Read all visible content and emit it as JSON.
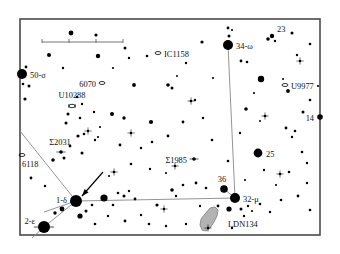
{
  "chart_title": "Star Finder Chart",
  "frame": {
    "x": 20,
    "y": 19,
    "width": 300,
    "height": 216,
    "border_color": "#4a4a4a",
    "background": "#ffffff"
  },
  "scale_bar": {
    "x1": 42,
    "x2": 123,
    "y": 42,
    "ticks": [
      42,
      69,
      96,
      123
    ],
    "label": "",
    "color": "#666666"
  },
  "colors": {
    "star": "#000000",
    "line": "#888888",
    "nebula_fill": "#b3b3b3",
    "nebula_stroke": "#7d7d7d",
    "text": "#111111",
    "border": "#4a4a4a",
    "arrow": "#000000"
  },
  "chart_data": {
    "type": "scatter",
    "xlabel": "",
    "ylabel": "",
    "grid": false,
    "legend": "none",
    "xlim": [
      20,
      320
    ],
    "ylim": [
      19,
      235
    ],
    "labeled_stars": [
      {
        "name": "50-σ",
        "x": 22,
        "y": 74,
        "r": 5.0,
        "label_dx": 8,
        "label_dy": 3.5,
        "anchor": "start"
      },
      {
        "name": "34-ω",
        "x": 228,
        "y": 45,
        "r": 5.0,
        "label_dx": 8,
        "label_dy": 3.5,
        "anchor": "start"
      },
      {
        "name": "23",
        "x": 272,
        "y": 36,
        "r": 2.2,
        "label_dx": 5,
        "label_dy": -4,
        "anchor": "start"
      },
      {
        "name": "14",
        "x": 320,
        "y": 117,
        "r": 2.8,
        "label_dx": -6,
        "label_dy": 3.5,
        "anchor": "end"
      },
      {
        "name": "25",
        "x": 258,
        "y": 153,
        "r": 4.4,
        "label_dx": 8,
        "label_dy": 3.5,
        "anchor": "start"
      },
      {
        "name": "36",
        "x": 224,
        "y": 189,
        "r": 3.8,
        "label_dx": -2,
        "label_dy": -7,
        "anchor": "middle"
      },
      {
        "name": "32-μ",
        "x": 235,
        "y": 198,
        "r": 5.0,
        "label_dx": 8,
        "label_dy": 3.5,
        "anchor": "start"
      },
      {
        "name": "1-δ",
        "x": 76,
        "y": 201,
        "r": 6.0,
        "label_dx": -9,
        "label_dy": 2,
        "anchor": "end"
      },
      {
        "name": "2-ε",
        "x": 44,
        "y": 227,
        "r": 6.0,
        "label_dx": -9,
        "label_dy": -3,
        "anchor": "end"
      }
    ],
    "labeled_objects": [
      {
        "name": "IC1158",
        "x": 158,
        "y": 53,
        "marker": "ellipse",
        "label_dx": 6,
        "label_dy": 3.5,
        "anchor": "start"
      },
      {
        "name": "U9977",
        "x": 285,
        "y": 85,
        "marker": "ellipse",
        "label_dx": 6,
        "label_dy": 3.5,
        "anchor": "start"
      },
      {
        "name": "6070",
        "x": 102,
        "y": 83,
        "marker": "ellipse",
        "label_dx": -6,
        "label_dy": 3.5,
        "anchor": "end"
      },
      {
        "name": "U10288",
        "x": 72,
        "y": 106,
        "marker": "barred",
        "label_dx": 0,
        "label_dy": -8,
        "anchor": "middle"
      },
      {
        "name": "6118",
        "x": 22,
        "y": 155,
        "marker": "ellipse",
        "label_dx": 0,
        "label_dy": 12,
        "anchor": "start"
      },
      {
        "name": "Σ2031",
        "x": 61,
        "y": 152,
        "marker": "double",
        "label_dx": -1,
        "label_dy": -7,
        "anchor": "middle"
      },
      {
        "name": "Σ1985",
        "x": 194,
        "y": 159,
        "marker": "double",
        "label_dx": -7,
        "label_dy": 3.5,
        "anchor": "end"
      }
    ],
    "nebula": {
      "name": "LDN134",
      "label_x": 228,
      "label_y": 227,
      "path": "M 205 214 L 210 208 L 215 207 L 218 210 L 217 216 L 214 222 L 210 228 L 206 231 L 202 230 L 200 225 L 201 219 Z"
    },
    "constellation_lines": [
      {
        "from": [
          76,
          201
        ],
        "to": [
          235,
          198
        ]
      },
      {
        "from": [
          235,
          198
        ],
        "to": [
          228,
          45
        ]
      },
      {
        "from": [
          76,
          201
        ],
        "to": [
          44,
          227
        ]
      },
      {
        "from": [
          76,
          201
        ],
        "to": [
          20,
          131
        ]
      },
      {
        "from": [
          76,
          201
        ],
        "to": [
          44,
          212
        ]
      },
      {
        "from": [
          44,
          227
        ],
        "to": [
          32,
          238
        ]
      },
      {
        "from": [
          235,
          198
        ],
        "to": [
          224,
          189
        ]
      }
    ],
    "pointer_arrow": {
      "from": [
        103,
        172
      ],
      "to": [
        82,
        196
      ]
    },
    "field_stars": [
      {
        "x": 71,
        "y": 33,
        "r": 2.4
      },
      {
        "x": 96,
        "y": 35,
        "r": 1.6
      },
      {
        "x": 125,
        "y": 48,
        "r": 1.5
      },
      {
        "x": 129,
        "y": 58,
        "r": 1.2
      },
      {
        "x": 49,
        "y": 55,
        "r": 2.0
      },
      {
        "x": 98,
        "y": 56,
        "r": 2.2
      },
      {
        "x": 147,
        "y": 56,
        "r": 1.3
      },
      {
        "x": 202,
        "y": 42,
        "r": 1.6
      },
      {
        "x": 228,
        "y": 28,
        "r": 1.4
      },
      {
        "x": 229,
        "y": 36,
        "r": 1.5
      },
      {
        "x": 232,
        "y": 30,
        "r": 1.1
      },
      {
        "x": 268,
        "y": 39,
        "r": 1.8
      },
      {
        "x": 275,
        "y": 41,
        "r": 1.2
      },
      {
        "x": 292,
        "y": 33,
        "r": 1.5
      },
      {
        "x": 310,
        "y": 44,
        "r": 1.3
      },
      {
        "x": 241,
        "y": 61,
        "r": 1.4
      },
      {
        "x": 247,
        "y": 62,
        "r": 1.3
      },
      {
        "x": 297,
        "y": 55,
        "r": 1.2
      },
      {
        "x": 26,
        "y": 67,
        "r": 1.4
      },
      {
        "x": 23,
        "y": 84,
        "r": 1.3
      },
      {
        "x": 29,
        "y": 86,
        "r": 1.5
      },
      {
        "x": 25,
        "y": 99,
        "r": 1.6
      },
      {
        "x": 134,
        "y": 85,
        "r": 1.9
      },
      {
        "x": 168,
        "y": 85,
        "r": 1.8
      },
      {
        "x": 172,
        "y": 88,
        "r": 1.5
      },
      {
        "x": 261,
        "y": 79,
        "r": 3.2
      },
      {
        "x": 283,
        "y": 79,
        "r": 1.0
      },
      {
        "x": 288,
        "y": 91,
        "r": 1.9
      },
      {
        "x": 310,
        "y": 100,
        "r": 1.3
      },
      {
        "x": 195,
        "y": 100,
        "r": 1.2
      },
      {
        "x": 246,
        "y": 109,
        "r": 1.8
      },
      {
        "x": 303,
        "y": 112,
        "r": 1.5
      },
      {
        "x": 77,
        "y": 97,
        "r": 1.2
      },
      {
        "x": 82,
        "y": 104,
        "r": 1.2
      },
      {
        "x": 68,
        "y": 114,
        "r": 1.5
      },
      {
        "x": 80,
        "y": 118,
        "r": 1.3
      },
      {
        "x": 94,
        "y": 112,
        "r": 1.2
      },
      {
        "x": 112,
        "y": 114,
        "r": 2.0
      },
      {
        "x": 124,
        "y": 118,
        "r": 1.7
      },
      {
        "x": 151,
        "y": 122,
        "r": 2.1
      },
      {
        "x": 183,
        "y": 122,
        "r": 1.4
      },
      {
        "x": 286,
        "y": 128,
        "r": 1.4
      },
      {
        "x": 295,
        "y": 131,
        "r": 1.3
      },
      {
        "x": 292,
        "y": 137,
        "r": 1.2
      },
      {
        "x": 66,
        "y": 123,
        "r": 1.5
      },
      {
        "x": 78,
        "y": 136,
        "r": 1.6
      },
      {
        "x": 84,
        "y": 134,
        "r": 1.3
      },
      {
        "x": 95,
        "y": 140,
        "r": 1.2
      },
      {
        "x": 70,
        "y": 146,
        "r": 1.4
      },
      {
        "x": 53,
        "y": 160,
        "r": 1.8
      },
      {
        "x": 64,
        "y": 158,
        "r": 1.5
      },
      {
        "x": 82,
        "y": 153,
        "r": 1.5
      },
      {
        "x": 98,
        "y": 137,
        "r": 1.1
      },
      {
        "x": 120,
        "y": 145,
        "r": 1.4
      },
      {
        "x": 141,
        "y": 148,
        "r": 1.2
      },
      {
        "x": 152,
        "y": 142,
        "r": 1.3
      },
      {
        "x": 150,
        "y": 169,
        "r": 1.2
      },
      {
        "x": 131,
        "y": 164,
        "r": 1.3
      },
      {
        "x": 168,
        "y": 136,
        "r": 1.4
      },
      {
        "x": 212,
        "y": 140,
        "r": 1.3
      },
      {
        "x": 240,
        "y": 133,
        "r": 1.2
      },
      {
        "x": 228,
        "y": 161,
        "r": 1.3
      },
      {
        "x": 264,
        "y": 170,
        "r": 1.2
      },
      {
        "x": 302,
        "y": 152,
        "r": 1.3
      },
      {
        "x": 307,
        "y": 163,
        "r": 1.2
      },
      {
        "x": 289,
        "y": 172,
        "r": 1.3
      },
      {
        "x": 31,
        "y": 178,
        "r": 1.4
      },
      {
        "x": 45,
        "y": 186,
        "r": 1.2
      },
      {
        "x": 62,
        "y": 209,
        "r": 2.4
      },
      {
        "x": 55,
        "y": 213,
        "r": 1.7
      },
      {
        "x": 86,
        "y": 211,
        "r": 1.5
      },
      {
        "x": 80,
        "y": 216,
        "r": 2.6
      },
      {
        "x": 92,
        "y": 205,
        "r": 1.3
      },
      {
        "x": 104,
        "y": 198,
        "r": 3.6
      },
      {
        "x": 118,
        "y": 193,
        "r": 1.3
      },
      {
        "x": 124,
        "y": 196,
        "r": 1.5
      },
      {
        "x": 129,
        "y": 191,
        "r": 1.2
      },
      {
        "x": 135,
        "y": 199,
        "r": 1.4
      },
      {
        "x": 113,
        "y": 205,
        "r": 1.3
      },
      {
        "x": 108,
        "y": 216,
        "r": 1.2
      },
      {
        "x": 95,
        "y": 224,
        "r": 1.3
      },
      {
        "x": 125,
        "y": 221,
        "r": 1.4
      },
      {
        "x": 141,
        "y": 215,
        "r": 1.2
      },
      {
        "x": 149,
        "y": 224,
        "r": 1.3
      },
      {
        "x": 157,
        "y": 205,
        "r": 1.6
      },
      {
        "x": 172,
        "y": 190,
        "r": 1.8
      },
      {
        "x": 183,
        "y": 185,
        "r": 1.3
      },
      {
        "x": 176,
        "y": 196,
        "r": 1.2
      },
      {
        "x": 196,
        "y": 183,
        "r": 1.4
      },
      {
        "x": 206,
        "y": 188,
        "r": 1.3
      },
      {
        "x": 218,
        "y": 206,
        "r": 1.4
      },
      {
        "x": 229,
        "y": 209,
        "r": 2.6
      },
      {
        "x": 241,
        "y": 209,
        "r": 1.5
      },
      {
        "x": 248,
        "y": 206,
        "r": 1.2
      },
      {
        "x": 252,
        "y": 211,
        "r": 1.1
      },
      {
        "x": 244,
        "y": 216,
        "r": 1.2
      },
      {
        "x": 260,
        "y": 204,
        "r": 1.3
      },
      {
        "x": 270,
        "y": 212,
        "r": 1.2
      },
      {
        "x": 281,
        "y": 200,
        "r": 1.3
      },
      {
        "x": 298,
        "y": 196,
        "r": 1.4
      },
      {
        "x": 310,
        "y": 210,
        "r": 1.3
      },
      {
        "x": 232,
        "y": 228,
        "r": 1.2
      },
      {
        "x": 200,
        "y": 206,
        "r": 1.2
      },
      {
        "x": 186,
        "y": 224,
        "r": 1.2
      },
      {
        "x": 166,
        "y": 226,
        "r": 1.2
      },
      {
        "x": 63,
        "y": 68,
        "r": 1.2
      },
      {
        "x": 113,
        "y": 68,
        "r": 1.1
      },
      {
        "x": 186,
        "y": 63,
        "r": 1.2
      },
      {
        "x": 177,
        "y": 76,
        "r": 1.0
      },
      {
        "x": 213,
        "y": 78,
        "r": 1.1
      },
      {
        "x": 254,
        "y": 93,
        "r": 1.1
      },
      {
        "x": 318,
        "y": 86,
        "r": 1.1
      },
      {
        "x": 100,
        "y": 127,
        "r": 1.1
      },
      {
        "x": 203,
        "y": 118,
        "r": 1.2
      },
      {
        "x": 260,
        "y": 121,
        "r": 1.0
      },
      {
        "x": 307,
        "y": 183,
        "r": 1.2
      },
      {
        "x": 276,
        "y": 185,
        "r": 1.1
      },
      {
        "x": 245,
        "y": 180,
        "r": 1.1
      },
      {
        "x": 166,
        "y": 173,
        "r": 1.1
      },
      {
        "x": 109,
        "y": 176,
        "r": 1.1
      }
    ],
    "cross_stars": [
      {
        "x": 191,
        "y": 101,
        "r": 1.3
      },
      {
        "x": 175,
        "y": 166,
        "r": 1.3
      },
      {
        "x": 114,
        "y": 172,
        "r": 1.3
      },
      {
        "x": 280,
        "y": 174,
        "r": 1.3
      },
      {
        "x": 265,
        "y": 116,
        "r": 1.3
      },
      {
        "x": 131,
        "y": 133,
        "r": 1.2
      },
      {
        "x": 164,
        "y": 209,
        "r": 1.2
      },
      {
        "x": 300,
        "y": 61,
        "r": 1.2
      },
      {
        "x": 88,
        "y": 131,
        "r": 1.2
      },
      {
        "x": 208,
        "y": 228,
        "r": 1.2
      }
    ]
  }
}
